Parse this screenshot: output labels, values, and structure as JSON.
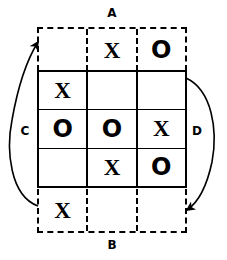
{
  "diagram": {
    "stroke_color": "#000000",
    "background_color": "#ffffff",
    "labels": {
      "top": "A",
      "bottom": "B",
      "left": "C",
      "right": "D"
    },
    "grid": {
      "columns": 3,
      "rows": 5,
      "solid_rows": 3,
      "ghost_rows": 2,
      "rows_data": [
        {
          "style": "dashed",
          "name": "ghost-row-top",
          "cells": [
            "",
            "X",
            "O"
          ]
        },
        {
          "style": "solid",
          "name": "board-row-1",
          "cells": [
            "X",
            "",
            ""
          ]
        },
        {
          "style": "solid",
          "name": "board-row-2",
          "cells": [
            "O",
            "O",
            "X"
          ]
        },
        {
          "style": "solid",
          "name": "board-row-3",
          "cells": [
            "",
            "X",
            "O"
          ]
        },
        {
          "style": "dashed",
          "name": "ghost-row-bottom",
          "cells": [
            "X",
            "",
            ""
          ]
        }
      ]
    },
    "arrows": [
      {
        "name": "arrow-c",
        "label": "C",
        "side": "left",
        "direction": "up"
      },
      {
        "name": "arrow-d",
        "label": "D",
        "side": "right",
        "direction": "down"
      }
    ]
  }
}
